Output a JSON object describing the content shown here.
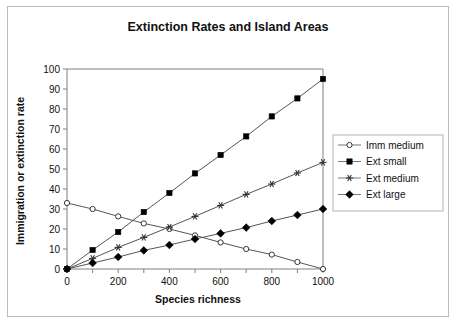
{
  "chart_data": {
    "type": "line",
    "title": "Extinction Rates and Island Areas",
    "xlabel": "Species richness",
    "ylabel": "Immigration or extinction rate",
    "xlim": [
      0,
      1000
    ],
    "ylim": [
      0,
      100
    ],
    "xticks": [
      0,
      100,
      200,
      300,
      400,
      500,
      600,
      700,
      800,
      900,
      1000
    ],
    "xtick_labels": [
      "0",
      "",
      "200",
      "",
      "400",
      "",
      "600",
      "",
      "800",
      "",
      "1000"
    ],
    "yticks": [
      0,
      10,
      20,
      30,
      40,
      50,
      60,
      70,
      80,
      90,
      100
    ],
    "ytick_labels": [
      "0",
      "10",
      "20",
      "30",
      "40",
      "50",
      "60",
      "70",
      "80",
      "90",
      "100"
    ],
    "grid": false,
    "legend_position": "right",
    "x": [
      0,
      100,
      200,
      300,
      400,
      500,
      600,
      700,
      800,
      900,
      1000
    ],
    "series": [
      {
        "name": "Imm medium",
        "marker": "open-circle",
        "values": [
          33,
          30,
          26.3,
          22.8,
          20,
          16.8,
          13.3,
          10,
          7.2,
          3.5,
          0
        ]
      },
      {
        "name": "Ext small",
        "marker": "filled-square",
        "values": [
          0,
          9.5,
          18.5,
          28.5,
          38,
          47.8,
          57,
          66.3,
          76.3,
          85.3,
          95
        ]
      },
      {
        "name": "Ext medium",
        "marker": "asterisk",
        "values": [
          0,
          5.3,
          10.8,
          15.8,
          21,
          26.3,
          31.8,
          37.3,
          42.5,
          48,
          53.3
        ]
      },
      {
        "name": "Ext large",
        "marker": "filled-diamond",
        "values": [
          0,
          3,
          6,
          9.3,
          12,
          15,
          17.8,
          20.7,
          24,
          27,
          30
        ]
      }
    ]
  },
  "colors": {
    "line": "#555555",
    "marker_fill": "#000000",
    "axis": "#808080",
    "frame": "#b9bcbe",
    "background": "#ffffff"
  }
}
